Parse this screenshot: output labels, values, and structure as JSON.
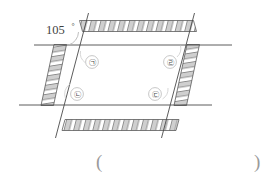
{
  "figure": {
    "angle_label": {
      "value": "105",
      "degree_symbol": "°"
    },
    "region_labels": [
      {
        "id": "region-top-left",
        "text": "㉠"
      },
      {
        "id": "region-bottom-left",
        "text": "㉡"
      },
      {
        "id": "region-bottom-right",
        "text": "㉢"
      },
      {
        "id": "region-top-right",
        "text": "㉣"
      }
    ],
    "colors": {
      "line": "#4a4a4a",
      "hatch_fill": "#cfcfcf",
      "hatch_edge": "#5a5a5a",
      "arc": "#b0b0b0",
      "text": "#3f3f3f",
      "paren": "#9a9a9a"
    }
  },
  "answer_blank": {
    "open_paren": "(",
    "close_paren": ")"
  }
}
